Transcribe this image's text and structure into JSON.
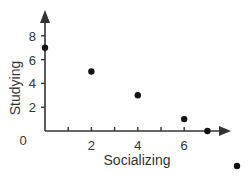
{
  "chart_data": {
    "type": "scatter",
    "title": "",
    "xlabel": "Socializing",
    "ylabel": "Studying",
    "x_ticks": [
      2,
      4,
      6
    ],
    "x_minor_ticks": [
      1,
      2,
      3,
      4,
      5,
      6
    ],
    "y_ticks": [
      2,
      4,
      6,
      8
    ],
    "origin_label": "0",
    "xlim": [
      0,
      8
    ],
    "ylim": [
      0,
      9
    ],
    "grid": false,
    "legend": null,
    "points": [
      {
        "x": 0,
        "y": 7
      },
      {
        "x": 2,
        "y": 5
      },
      {
        "x": 4,
        "y": 3
      },
      {
        "x": 6,
        "y": 1
      },
      {
        "x": 7,
        "y": 0
      },
      {
        "x": 8.2,
        "y": -3
      }
    ],
    "colors": {
      "axis": "#333333",
      "point": "#111111"
    }
  }
}
